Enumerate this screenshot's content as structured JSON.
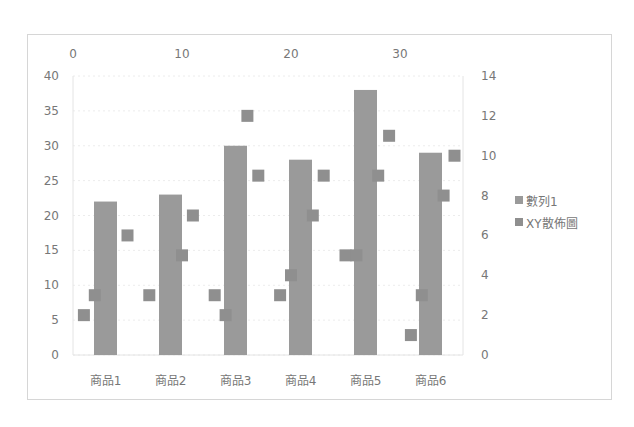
{
  "chart_data": {
    "type": "bar",
    "title": "",
    "categories": [
      "商品1",
      "商品2",
      "商品3",
      "商品4",
      "商品5",
      "商品6"
    ],
    "series": [
      {
        "name": "數列1",
        "type": "bar",
        "axis": "primary",
        "values": [
          22,
          23,
          30,
          28,
          38,
          29
        ]
      },
      {
        "name": "XY散佈圖",
        "type": "scatter",
        "axis": "secondary",
        "points": [
          [
            1,
            2
          ],
          [
            2,
            3
          ],
          [
            5,
            6
          ],
          [
            7,
            3
          ],
          [
            10,
            5
          ],
          [
            11,
            7
          ],
          [
            13,
            3
          ],
          [
            14,
            2
          ],
          [
            16,
            12
          ],
          [
            17,
            9
          ],
          [
            19,
            3
          ],
          [
            20,
            4
          ],
          [
            22,
            7
          ],
          [
            23,
            9
          ],
          [
            25,
            5
          ],
          [
            26,
            5
          ],
          [
            28,
            9
          ],
          [
            29,
            11
          ],
          [
            31,
            1
          ],
          [
            32,
            3
          ],
          [
            34,
            8
          ],
          [
            35,
            10
          ]
        ]
      }
    ],
    "left_axis": {
      "min": 0,
      "max": 40,
      "step": 5,
      "ticks": [
        "0",
        "5",
        "10",
        "15",
        "20",
        "25",
        "30",
        "35",
        "40"
      ]
    },
    "right_axis": {
      "min": 0,
      "max": 14,
      "step": 2,
      "ticks": [
        "0",
        "2",
        "4",
        "6",
        "8",
        "10",
        "12",
        "14"
      ]
    },
    "top_axis": {
      "min": 0,
      "max": 38.3,
      "ticks": [
        "0",
        "10",
        "20",
        "30"
      ]
    },
    "xlabel": "",
    "ylabel": "",
    "grid": true,
    "legend_position": "right",
    "colors": {
      "bar": "#9a9a9a",
      "scatter": "#8f8f8f",
      "grid": "#ececec",
      "border": "#d6d6d6"
    }
  },
  "legend": {
    "items": [
      {
        "label": "數列1",
        "color": "#9a9a9a"
      },
      {
        "label": "XY散佈圖",
        "color": "#8f8f8f"
      }
    ]
  }
}
